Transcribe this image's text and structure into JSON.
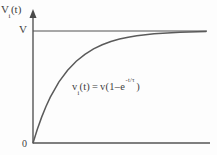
{
  "figure": {
    "title": "",
    "y_axis_label": {
      "base": "V",
      "subscript": "i",
      "suffix": "(t)"
    },
    "asymptote_label": "V",
    "origin_label": "0",
    "equation": {
      "lhs_base": "v",
      "lhs_subscript": "i",
      "lhs_suffix": "(t)",
      "equals": "=",
      "rhs_prefix": "v(1",
      "minus": "–",
      "base_e": "e",
      "exponent": "-t/τ",
      "rhs_suffix": ")",
      "full_text": "vᵢ(t) = v(1 – e^(-t/τ) )"
    },
    "colors": {
      "axis": "#555555",
      "curve": "#5a5a5a",
      "asymptote": "#8a8a8a",
      "background": "#fdfdfd",
      "text": "#3d3d3d"
    }
  },
  "chart_data": {
    "type": "line",
    "title": "",
    "xlabel": "",
    "ylabel": "Vᵢ(t)",
    "xlim": [
      0,
      10
    ],
    "ylim": [
      0,
      1.08
    ],
    "grid": false,
    "legend": null,
    "annotations": [
      {
        "text": "vᵢ(t) = v(1 – e^(-t/τ) )",
        "x": 3.1,
        "y": 0.47
      },
      {
        "text": "V",
        "x": 0,
        "y": 1.0
      },
      {
        "text": "0",
        "x": 0,
        "y": 0
      }
    ],
    "series": [
      {
        "name": "v_i(t) = V(1 - e^(-t/tau))",
        "tau": 1.9,
        "amplitude": 1.0,
        "x": [
          0,
          0.25,
          0.5,
          0.75,
          1.0,
          1.5,
          2.0,
          2.5,
          3.0,
          3.5,
          4.0,
          4.5,
          5.0,
          5.5,
          6.0,
          6.5,
          7.0,
          7.5,
          8.0,
          8.5,
          9.0,
          9.5,
          10.0
        ],
        "values": [
          0.0,
          0.123,
          0.231,
          0.326,
          0.41,
          0.546,
          0.65,
          0.73,
          0.792,
          0.84,
          0.877,
          0.906,
          0.928,
          0.944,
          0.957,
          0.967,
          0.975,
          0.981,
          0.985,
          0.989,
          0.991,
          0.993,
          0.995
        ]
      },
      {
        "name": "asymptote V",
        "x": [
          0,
          10
        ],
        "values": [
          1.0,
          1.0
        ]
      }
    ]
  }
}
